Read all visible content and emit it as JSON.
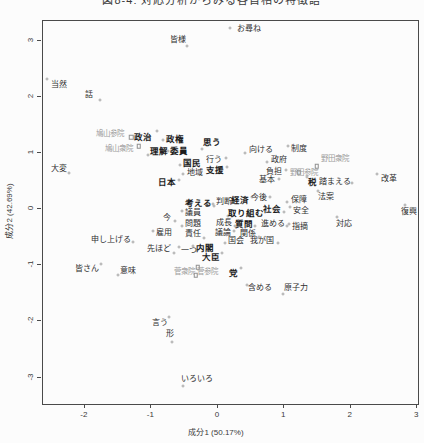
{
  "figure": {
    "title": "図8-4: 対応分析からみる各首相の特徴語"
  },
  "chart_data": {
    "type": "scatter",
    "title": "図8-4: 対応分析からみる各首相の特徴語",
    "xlabel": "成分1 (50.17%)",
    "ylabel": "成分2 (42.69%)",
    "xlim": [
      -2.63,
      3.01
    ],
    "ylim": [
      -3.47,
      3.35
    ],
    "x_ticks": [
      -2,
      -1,
      0,
      1,
      2,
      3
    ],
    "y_ticks": [
      3,
      2,
      1,
      0,
      -1,
      -2,
      -3
    ],
    "grid": false,
    "legend": "none",
    "marker_legend": {
      "circle": "word",
      "square": "document"
    },
    "points": [
      {
        "t": "お尋ね",
        "x": 0.47,
        "y": 3.2,
        "k": "w",
        "b": 0,
        "dx": -19,
        "dy": -1
      },
      {
        "t": "皆様",
        "x": -0.6,
        "y": 3.02,
        "k": "w",
        "b": 0,
        "dx": 9,
        "dy": 6
      },
      {
        "t": "当然",
        "x": -2.39,
        "y": 2.21,
        "k": "w",
        "b": 0,
        "dx": -12,
        "dy": -6
      },
      {
        "t": "話",
        "x": -1.94,
        "y": 2.03,
        "k": "w",
        "b": 0,
        "dx": 11,
        "dy": 5
      },
      {
        "t": "鳩山参院",
        "x": -1.62,
        "y": 1.33,
        "k": "d",
        "b": 0,
        "dx": 21,
        "dy": 3
      },
      {
        "t": "政治",
        "x": -1.13,
        "y": 1.28,
        "k": "w",
        "b": 1,
        "dx": 14,
        "dy": -6
      },
      {
        "t": "鳩山衆院",
        "x": -1.49,
        "y": 1.07,
        "k": "d",
        "b": 0,
        "dx": 20,
        "dy": -3
      },
      {
        "t": "政権",
        "x": -0.65,
        "y": 1.25,
        "k": "w",
        "b": 1,
        "dx": -12,
        "dy": 1
      },
      {
        "t": "思う",
        "x": -0.09,
        "y": 1.19,
        "k": "w",
        "b": 1,
        "dx": -10,
        "dy": 7
      },
      {
        "t": "理解",
        "x": -0.89,
        "y": 1.03,
        "k": "w",
        "b": 1,
        "dx": -11,
        "dy": 4
      },
      {
        "t": "委員",
        "x": -0.59,
        "y": 1.03,
        "k": "w",
        "b": 1,
        "dx": -11,
        "dy": 0
      },
      {
        "t": "国民",
        "x": -0.39,
        "y": 0.82,
        "k": "w",
        "b": 1,
        "dx": -12,
        "dy": 2
      },
      {
        "t": "行う",
        "x": -0.06,
        "y": 0.87,
        "k": "w",
        "b": 0,
        "dx": 12,
        "dy": -2
      },
      {
        "t": "地域",
        "x": -0.35,
        "y": 0.64,
        "k": "w",
        "b": 0,
        "dx": -12,
        "dy": 1
      },
      {
        "t": "支援",
        "x": -0.05,
        "y": 0.69,
        "k": "w",
        "b": 1,
        "dx": 12,
        "dy": -3
      },
      {
        "t": "大変",
        "x": -2.39,
        "y": 0.71,
        "k": "w",
        "b": 0,
        "dx": 10,
        "dy": 4
      },
      {
        "t": "日本",
        "x": -0.77,
        "y": 0.48,
        "k": "w",
        "b": 1,
        "dx": 12,
        "dy": -2
      },
      {
        "t": "向ける",
        "x": 0.65,
        "y": 1.05,
        "k": "w",
        "b": 0,
        "dx": -16,
        "dy": 3
      },
      {
        "t": "制度",
        "x": 1.22,
        "y": 1.07,
        "k": "w",
        "b": 0,
        "dx": -11,
        "dy": -3
      },
      {
        "t": "政府",
        "x": 0.92,
        "y": 0.87,
        "k": "w",
        "b": 0,
        "dx": -12,
        "dy": 2
      },
      {
        "t": "野田衆院",
        "x": 1.76,
        "y": 0.89,
        "k": "d",
        "b": 0,
        "dx": -18,
        "dy": 7
      },
      {
        "t": "負担",
        "x": 0.84,
        "y": 0.66,
        "k": "w",
        "b": 0,
        "dx": 12,
        "dy": -2
      },
      {
        "t": "野田参院",
        "x": 1.29,
        "y": 0.64,
        "k": "d",
        "b": 0,
        "dx": -5,
        "dy": -1
      },
      {
        "t": "基本",
        "x": 0.74,
        "y": 0.52,
        "k": "w",
        "b": 0,
        "dx": 12,
        "dy": -1
      },
      {
        "t": "税",
        "x": 1.43,
        "y": 0.48,
        "k": "w",
        "b": 1,
        "dx": -6,
        "dy": -5
      },
      {
        "t": "踏まえる",
        "x": 1.76,
        "y": 0.48,
        "k": "w",
        "b": 0,
        "dx": 17,
        "dy": 1
      },
      {
        "t": "改革",
        "x": 2.57,
        "y": 0.53,
        "k": "w",
        "b": 0,
        "dx": -12,
        "dy": -5
      },
      {
        "t": "経済",
        "x": 0.33,
        "y": 0.16,
        "k": "w",
        "b": 1,
        "dx": 12,
        "dy": -3
      },
      {
        "t": "今後",
        "x": 0.62,
        "y": 0.2,
        "k": "w",
        "b": 0,
        "dx": 11,
        "dy": -1
      },
      {
        "t": "保障",
        "x": 1.22,
        "y": 0.16,
        "k": "w",
        "b": 0,
        "dx": -12,
        "dy": 2
      },
      {
        "t": "法案",
        "x": 1.62,
        "y": 0.21,
        "k": "w",
        "b": 0,
        "dx": -8,
        "dy": -6
      },
      {
        "t": "考える",
        "x": -0.29,
        "y": 0.11,
        "k": "w",
        "b": 1,
        "dx": 15,
        "dy": 3
      },
      {
        "t": "判断",
        "x": 0.09,
        "y": 0.12,
        "k": "w",
        "b": 0,
        "dx": -11,
        "dy": 2
      },
      {
        "t": "議員",
        "x": -0.38,
        "y": -0.07,
        "k": "w",
        "b": 0,
        "dx": -11,
        "dy": -2
      },
      {
        "t": "取り組む",
        "x": 0.42,
        "y": -0.07,
        "k": "w",
        "b": 1,
        "dx": -18,
        "dy": 3
      },
      {
        "t": "社会",
        "x": 0.81,
        "y": 0.0,
        "k": "w",
        "b": 1,
        "dx": 12,
        "dy": 3
      },
      {
        "t": "安全",
        "x": 1.25,
        "y": -0.04,
        "k": "w",
        "b": 0,
        "dx": -11,
        "dy": -4
      },
      {
        "t": "今",
        "x": -0.77,
        "y": -0.16,
        "k": "w",
        "b": 0,
        "dx": 8,
        "dy": 3
      },
      {
        "t": "問題",
        "x": -0.38,
        "y": -0.27,
        "k": "w",
        "b": 0,
        "dx": -11,
        "dy": 2
      },
      {
        "t": "成長",
        "x": 0.09,
        "y": -0.25,
        "k": "w",
        "b": 0,
        "dx": 11,
        "dy": 3
      },
      {
        "t": "質問",
        "x": 0.39,
        "y": -0.27,
        "k": "w",
        "b": 1,
        "dx": 11,
        "dy": 2
      },
      {
        "t": "進める",
        "x": 0.83,
        "y": -0.27,
        "k": "w",
        "b": 0,
        "dx": 14,
        "dy": 2
      },
      {
        "t": "指摘",
        "x": 1.23,
        "y": -0.32,
        "k": "w",
        "b": 0,
        "dx": -11,
        "dy": -3
      },
      {
        "t": "雇用",
        "x": -0.81,
        "y": -0.43,
        "k": "w",
        "b": 0,
        "dx": -11,
        "dy": -2
      },
      {
        "t": "責任",
        "x": -0.38,
        "y": -0.44,
        "k": "w",
        "b": 0,
        "dx": 11,
        "dy": 4
      },
      {
        "t": "議論",
        "x": 0.08,
        "y": -0.43,
        "k": "w",
        "b": 0,
        "dx": 11,
        "dy": -2
      },
      {
        "t": "関係",
        "x": 0.45,
        "y": -0.44,
        "k": "w",
        "b": 0,
        "dx": 11,
        "dy": 3
      },
      {
        "t": "対応",
        "x": 1.89,
        "y": -0.27,
        "k": "w",
        "b": 0,
        "dx": -7,
        "dy": -7
      },
      {
        "t": "復興",
        "x": 2.87,
        "y": -0.05,
        "k": "w",
        "b": 0,
        "dx": -4,
        "dy": -7
      },
      {
        "t": "国会",
        "x": 0.27,
        "y": -0.57,
        "k": "w",
        "b": 0,
        "dx": -11,
        "dy": 2
      },
      {
        "t": "我が国",
        "x": 0.66,
        "y": -0.57,
        "k": "w",
        "b": 0,
        "dx": 16,
        "dy": 2
      },
      {
        "t": "内閣",
        "x": -0.2,
        "y": -0.69,
        "k": "w",
        "b": 1,
        "dx": -12,
        "dy": -2
      },
      {
        "t": "大臣",
        "x": -0.11,
        "y": -0.85,
        "k": "w",
        "b": 1,
        "dx": 11,
        "dy": -4
      },
      {
        "t": "先ほど",
        "x": -0.89,
        "y": -0.71,
        "k": "w",
        "b": 0,
        "dx": 15,
        "dy": 4
      },
      {
        "t": "一つ",
        "x": -0.44,
        "y": -0.75,
        "k": "w",
        "b": 0,
        "dx": -10,
        "dy": -4
      },
      {
        "t": "申し上げる",
        "x": -1.61,
        "y": -0.55,
        "k": "w",
        "b": 0,
        "dx": 22,
        "dy": 2
      },
      {
        "t": "菅衆院",
        "x": -0.5,
        "y": -1.12,
        "k": "d",
        "b": 0,
        "dx": 13,
        "dy": -5
      },
      {
        "t": "菅参院",
        "x": -0.15,
        "y": -1.12,
        "k": "d",
        "b": 0,
        "dx": -12,
        "dy": 3
      },
      {
        "t": "党",
        "x": 0.24,
        "y": -1.14,
        "k": "w",
        "b": 1,
        "dx": 7,
        "dy": -5
      },
      {
        "t": "皆さん",
        "x": -1.97,
        "y": -1.07,
        "k": "w",
        "b": 0,
        "dx": 14,
        "dy": -5
      },
      {
        "t": "意味",
        "x": -1.35,
        "y": -1.1,
        "k": "w",
        "b": 0,
        "dx": -10,
        "dy": 4
      },
      {
        "t": "含める",
        "x": 0.63,
        "y": -1.41,
        "k": "w",
        "b": 0,
        "dx": -13,
        "dy": -3
      },
      {
        "t": "原子力",
        "x": 1.17,
        "y": -1.41,
        "k": "w",
        "b": 0,
        "dx": -13,
        "dy": 6
      },
      {
        "t": "言う",
        "x": -0.87,
        "y": -2.03,
        "k": "w",
        "b": 0,
        "dx": 9,
        "dy": -6
      },
      {
        "t": "形",
        "x": -0.72,
        "y": -2.22,
        "k": "w",
        "b": 0,
        "dx": 2,
        "dy": 8
      },
      {
        "t": "いろいろ",
        "x": -0.32,
        "y": -3.02,
        "k": "w",
        "b": 0,
        "dx": -14,
        "dy": 7
      }
    ]
  }
}
